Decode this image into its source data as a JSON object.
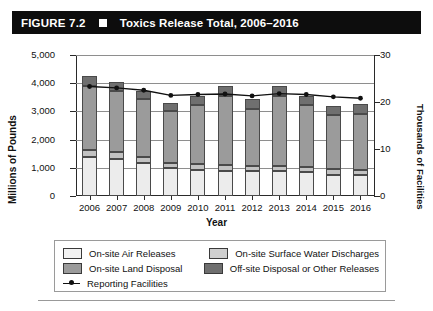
{
  "figure": {
    "number_label": "FIGURE 7.2",
    "marker_icon": "white-square-icon",
    "title": "Toxics Release Total, 2006–2016"
  },
  "chart_data": {
    "type": "bar",
    "subtype": "stacked-bar-with-line-overlay",
    "title": "Toxics Release Total, 2006–2016",
    "xlabel": "Year",
    "ylabel": "Millions of Pounds",
    "ylabel_secondary": "Thousands of Facilities",
    "categories": [
      "2006",
      "2007",
      "2008",
      "2009",
      "2010",
      "2011",
      "2012",
      "2013",
      "2014",
      "2015",
      "2016"
    ],
    "ylim": [
      0,
      5000
    ],
    "yticks": [
      0,
      1000,
      2000,
      3000,
      4000,
      5000
    ],
    "ytick_labels": [
      "0",
      "1,000",
      "2,000",
      "3,000",
      "4,000",
      "5,000"
    ],
    "ylim_secondary": [
      0,
      30
    ],
    "yticks_secondary": [
      0,
      10,
      20,
      30
    ],
    "ytick_labels_secondary": [
      "0",
      "10",
      "20",
      "30"
    ],
    "grid": true,
    "legend_position": "bottom",
    "series": [
      {
        "name": "On-site Air Releases",
        "color": "#ececec",
        "axis": "left",
        "values": [
          1400,
          1330,
          1180,
          980,
          930,
          900,
          880,
          870,
          840,
          760,
          740
        ]
      },
      {
        "name": "On-site Surface Water Discharges",
        "color": "#c2c2c2",
        "axis": "left",
        "values": [
          230,
          220,
          210,
          200,
          200,
          210,
          200,
          210,
          200,
          190,
          190
        ]
      },
      {
        "name": "On-site Land Disposal",
        "color": "#9b9b9b",
        "axis": "left",
        "values": [
          2280,
          2160,
          2040,
          1840,
          2110,
          2440,
          2020,
          2450,
          2180,
          1930,
          1990
        ]
      },
      {
        "name": "Off-site Disposal or Other Releases",
        "color": "#6f6f6f",
        "axis": "left",
        "values": [
          350,
          330,
          300,
          290,
          320,
          360,
          330,
          360,
          340,
          330,
          340
        ]
      },
      {
        "name": "Reporting Facilities",
        "color": "#111111",
        "axis": "right",
        "marker": "filled-circle",
        "values": [
          23.3,
          23.0,
          22.5,
          21.4,
          21.6,
          21.7,
          21.3,
          21.8,
          21.6,
          21.1,
          20.8
        ]
      }
    ],
    "totals": [
      4260,
      4040,
      3730,
      3310,
      3560,
      3910,
      3430,
      3890,
      3560,
      3210,
      3260
    ]
  },
  "legend": {
    "items": [
      {
        "label": "On-site Air Releases",
        "swatch": "sw-air",
        "type": "swatch"
      },
      {
        "label": "On-site Surface Water Discharges",
        "swatch": "sw-water",
        "type": "swatch"
      },
      {
        "label": "On-site Land Disposal",
        "swatch": "sw-land",
        "type": "swatch"
      },
      {
        "label": "Off-site Disposal or Other Releases",
        "swatch": "sw-off",
        "type": "swatch"
      },
      {
        "label": "Reporting Facilities",
        "swatch": "line-marker",
        "type": "line"
      }
    ]
  }
}
